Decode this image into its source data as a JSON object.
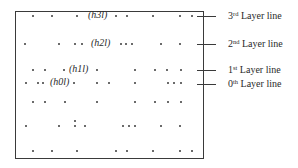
{
  "diagram": {
    "type": "diffraction-layer-lines",
    "frame": {
      "left": 15,
      "top": 11,
      "right": 204,
      "bottom": 159
    },
    "rows": [
      {
        "y": 16,
        "dots_x": [
          33,
          52,
          77,
          116,
          127,
          153,
          180,
          192
        ],
        "label": {
          "text": "(h3l)",
          "x": 88
        }
      },
      {
        "y": 44,
        "dots_x": [
          25,
          59,
          75,
          82,
          121,
          126,
          132,
          161,
          180
        ],
        "label": {
          "text": "(h2l)",
          "x": 91
        }
      },
      {
        "y": 70,
        "dots_x": [
          33,
          45,
          64,
          97,
          135,
          155,
          167,
          181
        ],
        "label": {
          "text": "(h1l)",
          "x": 69
        }
      },
      {
        "y": 83,
        "dots_x": [
          26,
          38,
          43,
          74,
          97,
          109,
          135,
          168,
          174,
          181
        ],
        "label": {
          "text": "(h0l)",
          "x": 50
        }
      },
      {
        "y": 102,
        "dots_x": [
          33,
          45,
          65,
          97,
          135,
          155,
          168,
          181
        ],
        "label": null
      },
      {
        "y": 126,
        "dots_x": [
          26,
          59,
          75,
          85,
          123,
          129,
          135,
          161,
          180
        ],
        "extra_dots": [
          {
            "x": 75,
            "y": 121
          }
        ],
        "label": null
      },
      {
        "y": 151,
        "dots_x": [
          33,
          52,
          77,
          116,
          127,
          153,
          180,
          192
        ],
        "label": null
      }
    ],
    "layer_lines": [
      {
        "ordinal": "3",
        "suffix": "rd",
        "text": "Layer line",
        "y": 16
      },
      {
        "ordinal": "2",
        "suffix": "nd",
        "text": "Layer line",
        "y": 44
      },
      {
        "ordinal": "1",
        "suffix": "st",
        "text": "Layer line",
        "y": 70
      },
      {
        "ordinal": "0",
        "suffix": "th",
        "text": "Layer line",
        "y": 84
      }
    ],
    "labels": {
      "h3l": "(h3l)",
      "h2l": "(h2l)",
      "h1l": "(h1l)",
      "h0l": "(h0l)"
    }
  }
}
